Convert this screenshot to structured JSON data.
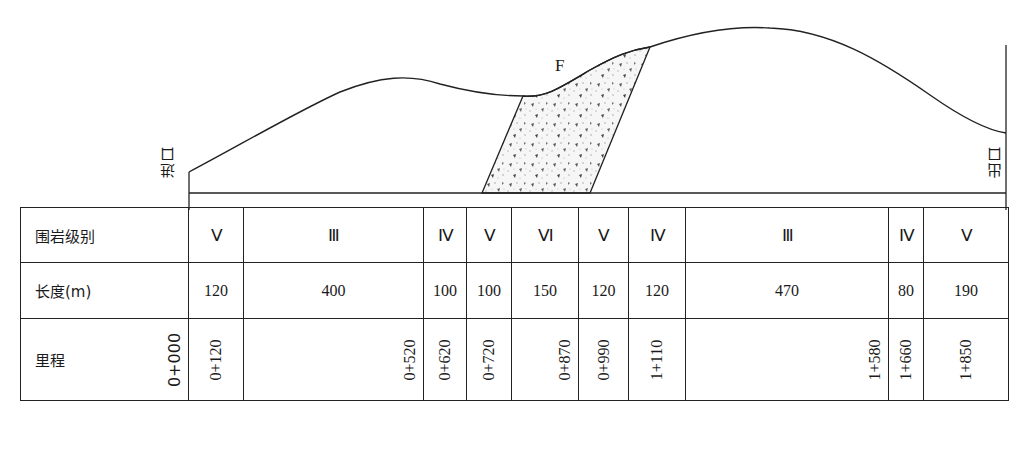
{
  "profile": {
    "entrance_label": "进口",
    "exit_label": "出口",
    "fault_label": "F"
  },
  "table": {
    "row_headers": {
      "grade": "围岩级别",
      "length": "长度(m)",
      "chainage": "里程"
    },
    "segments": [
      {
        "grade": "Ⅴ",
        "length": "120",
        "end_chainage": "0+120"
      },
      {
        "grade": "Ⅲ",
        "length": "400",
        "end_chainage": "0+520"
      },
      {
        "grade": "Ⅳ",
        "length": "100",
        "end_chainage": "0+620"
      },
      {
        "grade": "Ⅴ",
        "length": "100",
        "end_chainage": "0+720"
      },
      {
        "grade": "Ⅵ",
        "length": "150",
        "end_chainage": "0+870"
      },
      {
        "grade": "Ⅴ",
        "length": "120",
        "end_chainage": "0+990"
      },
      {
        "grade": "Ⅳ",
        "length": "120",
        "end_chainage": "1+110"
      },
      {
        "grade": "Ⅲ",
        "length": "470",
        "end_chainage": "1+580"
      },
      {
        "grade": "Ⅳ",
        "length": "80",
        "end_chainage": "1+660"
      },
      {
        "grade": "Ⅴ",
        "length": "190",
        "end_chainage": "1+850"
      }
    ],
    "start_chainage": "0+000"
  }
}
